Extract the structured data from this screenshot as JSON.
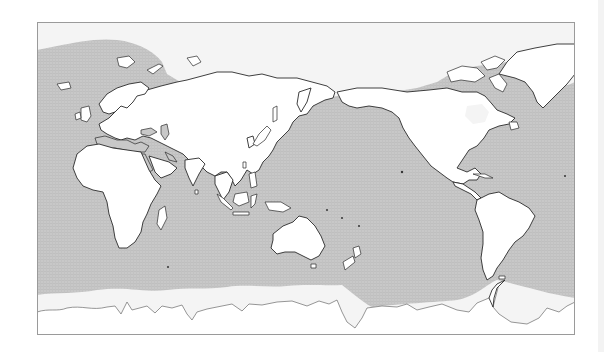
{
  "figure": {
    "type": "world-map",
    "projection": "equirectangular, Pacific-centred",
    "colors": {
      "ocean": "#c8c8c8",
      "ocean_grid": "#bdbdbd",
      "land": "#ffffff",
      "coastline": "#2a2a2a",
      "sea_ice": "#f4f4f4",
      "frame": "#9a9a9a",
      "background": "#ffffff"
    },
    "layers": [
      {
        "name": "ocean",
        "style": "light grey fine-hatched fill"
      },
      {
        "name": "sea-ice",
        "style": "pale margin at polar latitudes (Arctic, Southern Ocean)"
      },
      {
        "name": "land",
        "style": "white fill, thin black coastline"
      }
    ],
    "regions_visible": [
      "Europe",
      "Africa",
      "Asia",
      "Australia",
      "New Zealand",
      "North America",
      "Greenland",
      "South America",
      "Antarctica",
      "Pacific Ocean",
      "Atlantic Ocean",
      "Indian Ocean",
      "Arctic Ocean",
      "Southern Ocean"
    ],
    "labels": []
  }
}
